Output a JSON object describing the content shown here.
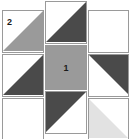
{
  "diagram": {
    "type": "half-square-triangle-grid",
    "grid": {
      "columns": 3,
      "rows": 3
    },
    "colors": {
      "background": "#ffffff",
      "outline": "#9a9a9a",
      "medium_gray": "#9a9a9a",
      "dark_gray": "#4a4a4a",
      "light_gray": "#e2e2e2",
      "label_text": "#1a1a1a"
    },
    "labels": {
      "piece_one": "1",
      "piece_two": "2"
    },
    "columns": [
      {
        "name": "left-column",
        "patches": [
          {
            "name": "patch-left-top",
            "fill": "half-triangle",
            "shade": "medium_gray",
            "corner": "bottom-left-to-top-right",
            "label": "2"
          },
          {
            "name": "patch-left-middle",
            "fill": "half-triangle",
            "shade": "dark_gray",
            "corner": "bottom-left-to-top-right",
            "label": ""
          },
          {
            "name": "patch-left-bottom",
            "fill": "plain",
            "shade": "background",
            "corner": "",
            "label": ""
          }
        ]
      },
      {
        "name": "middle-column",
        "patches": [
          {
            "name": "patch-middle-top",
            "fill": "half-triangle",
            "shade": "dark_gray",
            "corner": "top-right",
            "label": ""
          },
          {
            "name": "patch-middle-center",
            "fill": "solid",
            "shade": "medium_gray",
            "corner": "",
            "label": "1"
          },
          {
            "name": "patch-middle-bottom",
            "fill": "half-triangle",
            "shade": "dark_gray",
            "corner": "top-left",
            "label": ""
          }
        ]
      },
      {
        "name": "right-column",
        "patches": [
          {
            "name": "patch-right-top",
            "fill": "plain",
            "shade": "background",
            "corner": "",
            "label": ""
          },
          {
            "name": "patch-right-middle",
            "fill": "half-triangle",
            "shade": "dark_gray",
            "corner": "top-right",
            "label": ""
          },
          {
            "name": "patch-right-bottom",
            "fill": "half-triangle",
            "shade": "light_gray",
            "corner": "bottom-left",
            "label": ""
          }
        ]
      }
    ]
  }
}
